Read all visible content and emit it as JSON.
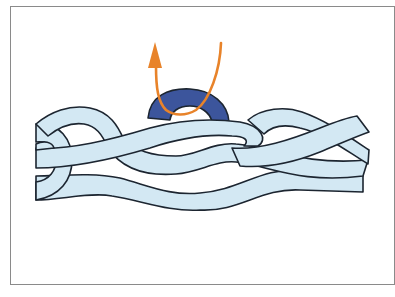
{
  "figure": {
    "colors": {
      "frame_border": "#8a8a8a",
      "strand_fill": "#d3e8f3",
      "strand_outline": "#1c2530",
      "ring_fill": "#3c559c",
      "arrow": "#e8832a",
      "background": "#ffffff"
    },
    "elements": [
      {
        "name": "braided-rope",
        "description": "Three light-blue strands braided horizontally"
      },
      {
        "name": "ring",
        "description": "Dark blue half-ring sitting on top of the braid"
      },
      {
        "name": "pull-arrow",
        "description": "Orange cord looping through the ring with arrowhead pointing up"
      }
    ],
    "icons": {
      "arrowhead": "arrow-up-icon"
    }
  }
}
